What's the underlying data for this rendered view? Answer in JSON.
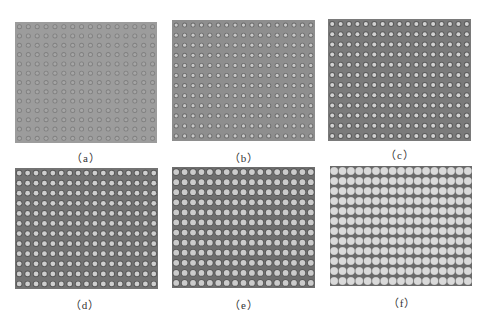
{
  "figure": {
    "panels": [
      {
        "id": "a",
        "label": "（a）",
        "x": 15,
        "y": 22,
        "w": 142,
        "h": 121,
        "cols": 16,
        "rows": 13,
        "bg": "#9c9c9c",
        "dot": "#a6a6a6",
        "ring": "#808080",
        "r": 1.6,
        "ringw": 0.9,
        "caption_x": 56,
        "caption_y": 149
      },
      {
        "id": "b",
        "label": "（b）",
        "x": 172,
        "y": 20,
        "w": 143,
        "h": 121,
        "cols": 17,
        "rows": 12,
        "bg": "#8e8e8e",
        "dot": "#c9c9c9",
        "ring": "#6c6c6c",
        "r": 1.6,
        "ringw": 0.9,
        "caption_x": 214,
        "caption_y": 149
      },
      {
        "id": "c",
        "label": "（c）",
        "x": 328,
        "y": 19,
        "w": 143,
        "h": 122,
        "cols": 17,
        "rows": 12,
        "bg": "#7a7a7a",
        "dot": "#d2d2d2",
        "ring": "#5c5c5c",
        "r": 2.0,
        "ringw": 1.0,
        "caption_x": 370,
        "caption_y": 146
      },
      {
        "id": "d",
        "label": "（d）",
        "x": 15,
        "y": 168,
        "w": 143,
        "h": 121,
        "cols": 17,
        "rows": 12,
        "bg": "#737373",
        "dot": "#cfcfcf",
        "ring": "#585858",
        "r": 2.4,
        "ringw": 0.9,
        "caption_x": 55,
        "caption_y": 296
      },
      {
        "id": "e",
        "label": "（e）",
        "x": 172,
        "y": 167,
        "w": 143,
        "h": 121,
        "cols": 17,
        "rows": 12,
        "bg": "#6e6e6e",
        "dot": "#cccccc",
        "ring": "#555555",
        "r": 2.9,
        "ringw": 0.8,
        "caption_x": 214,
        "caption_y": 296
      },
      {
        "id": "f",
        "label": "（f）",
        "x": 330,
        "y": 166,
        "w": 142,
        "h": 120,
        "cols": 17,
        "rows": 12,
        "bg": "#6a6a6a",
        "dot": "#dadada",
        "ring": "#9a9a9a",
        "r": 3.7,
        "ringw": 0.4,
        "caption_x": 372,
        "caption_y": 294
      }
    ]
  }
}
